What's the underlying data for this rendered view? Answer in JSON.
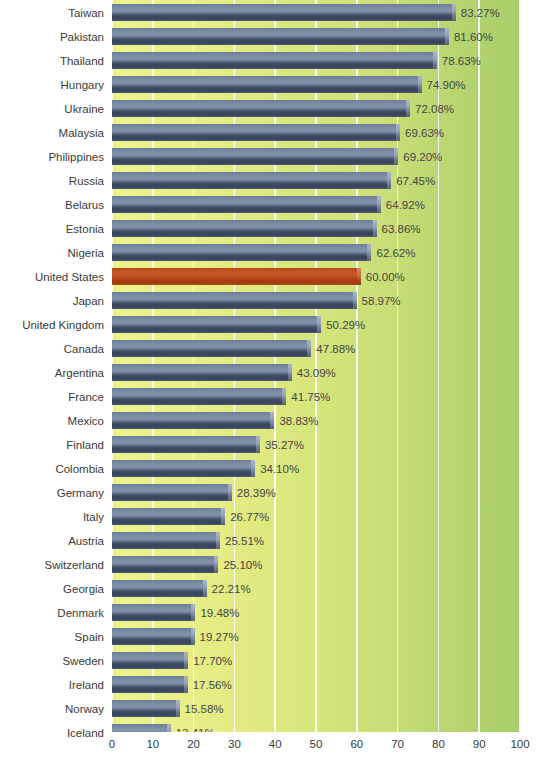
{
  "chart_data": {
    "type": "bar",
    "orientation": "horizontal",
    "title": "",
    "subtitle": "",
    "xlabel": "",
    "ylabel": "",
    "xlim": [
      0,
      100
    ],
    "xticks": [
      0,
      10,
      20,
      30,
      40,
      50,
      60,
      70,
      80,
      90,
      100
    ],
    "xtick_labels": [
      "0",
      "10",
      "20",
      "30",
      "40",
      "50",
      "60",
      "70",
      "80",
      "90",
      "100"
    ],
    "grid": true,
    "grid_axis": "x",
    "legend": false,
    "value_label_suffix": "%",
    "highlight_category": "United States",
    "colors": {
      "bar": "#6f7f9e",
      "bar_dark": "#39435a",
      "highlight": "#b8491c",
      "highlight_dark": "#a33a10",
      "background_left": "#eff08a",
      "background_right": "#a8ce6b",
      "gridline": "#ffffff",
      "text": "#3a3a3a",
      "value_text": "#454545",
      "plot_background": "#ffffff"
    },
    "categories": [
      "Taiwan",
      "Pakistan",
      "Thailand",
      "Hungary",
      "Ukraine",
      "Malaysia",
      "Philippines",
      "Russia",
      "Belarus",
      "Estonia",
      "Nigeria",
      "United States",
      "Japan",
      "United Kingdom",
      "Canada",
      "Argentina",
      "France",
      "Mexico",
      "Finland",
      "Colombia",
      "Germany",
      "Italy",
      "Austria",
      "Switzerland",
      "Georgia",
      "Denmark",
      "Spain",
      "Sweden",
      "Ireland",
      "Norway",
      "Iceland"
    ],
    "values": [
      83.27,
      81.6,
      78.63,
      74.9,
      72.08,
      69.63,
      69.2,
      67.45,
      64.92,
      63.86,
      62.62,
      60.0,
      58.97,
      50.29,
      47.88,
      43.09,
      41.75,
      38.83,
      35.27,
      34.1,
      28.39,
      26.77,
      25.51,
      25.1,
      22.21,
      19.48,
      19.27,
      17.7,
      17.56,
      15.58,
      13.41
    ],
    "value_labels": [
      "83.27%",
      "81.60%",
      "78.63%",
      "74.90%",
      "72.08%",
      "69.63%",
      "69.20%",
      "67.45%",
      "64.92%",
      "63.86%",
      "62.62%",
      "60.00%",
      "58.97%",
      "50.29%",
      "47.88%",
      "43.09%",
      "41.75%",
      "38.83%",
      "35.27%",
      "34.10%",
      "28.39%",
      "26.77%",
      "25.51%",
      "25.10%",
      "22.21%",
      "19.48%",
      "19.27%",
      "17.70%",
      "17.56%",
      "15.58%",
      "13.41%"
    ]
  }
}
